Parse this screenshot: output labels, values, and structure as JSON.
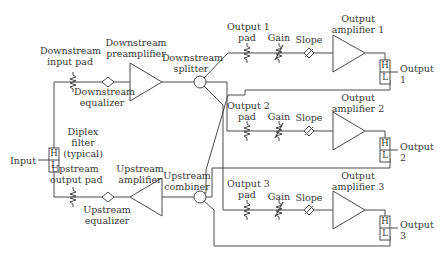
{
  "diagram": {
    "type": "block-diagram",
    "labels": {
      "input": "Input",
      "diplex_1": "Diplex",
      "diplex_2": "filter",
      "diplex_3": "(typical)",
      "ds_input_pad_1": "Downstream",
      "ds_input_pad_2": "input pad",
      "ds_preamp_1": "Downstream",
      "ds_preamp_2": "preamplifier",
      "ds_equalizer_1": "Downstream",
      "ds_equalizer_2": "equalizer",
      "ds_splitter_1": "Downstream",
      "ds_splitter_2": "splitter",
      "us_output_pad_1": "Upstream",
      "us_output_pad_2": "output pad",
      "us_amplifier_1": "Upstream",
      "us_amplifier_2": "amplifier",
      "us_equalizer_1": "Upstream",
      "us_equalizer_2": "equalizer",
      "us_combiner_1": "Upstream",
      "us_combiner_2": "combiner",
      "out1_pad_1": "Output 1",
      "out1_pad_2": "pad",
      "out2_pad_1": "Output 2",
      "out2_pad_2": "pad",
      "out3_pad_1": "Output 3",
      "out3_pad_2": "pad",
      "gain": "Gain",
      "slope": "Slope",
      "out_amp1_1": "Output",
      "out_amp1_2": "amplifier 1",
      "out_amp2_1": "Output",
      "out_amp2_2": "amplifier 2",
      "out_amp3_1": "Output",
      "out_amp3_2": "amplifier 3",
      "output1_1": "Output",
      "output1_2": "1",
      "output2_1": "Output",
      "output2_2": "2",
      "output3_1": "Output",
      "output3_2": "3",
      "high": "H",
      "low": "L"
    },
    "colors": {
      "line": "#4a4a4a",
      "text": "#3a3a3a",
      "background": "#ffffff"
    }
  }
}
